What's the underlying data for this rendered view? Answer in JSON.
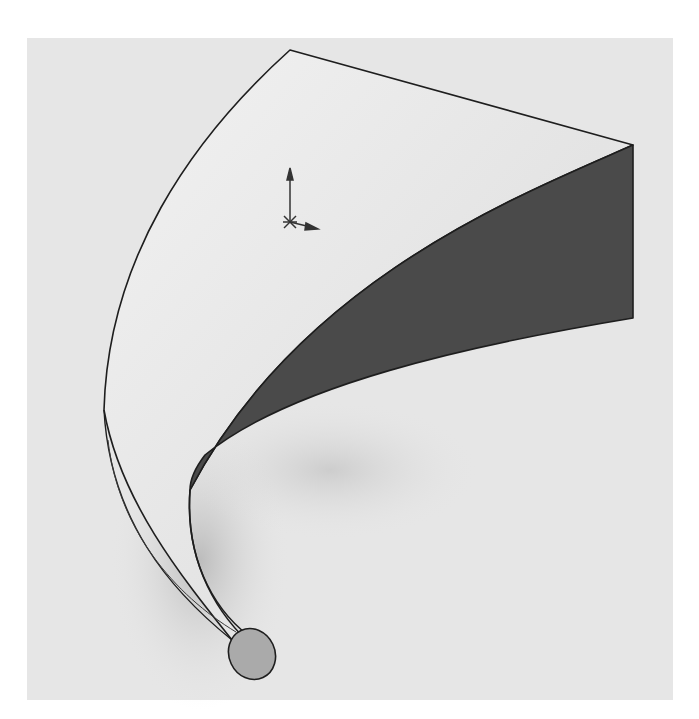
{
  "figure": {
    "colors": {
      "background": "#ffffff",
      "viewport": "#e6e6e6",
      "light_face": "#ececec",
      "dark_face": "#4a4a4a",
      "end_cap": "#aaaaaa",
      "edge": "#1e1e1e",
      "triad": "#333333"
    },
    "elements": {
      "surface": "swept-body",
      "dark_face": "inner-shaded-face",
      "end_cap": "circular-profile-end",
      "triad": "coordinate-triad"
    }
  }
}
